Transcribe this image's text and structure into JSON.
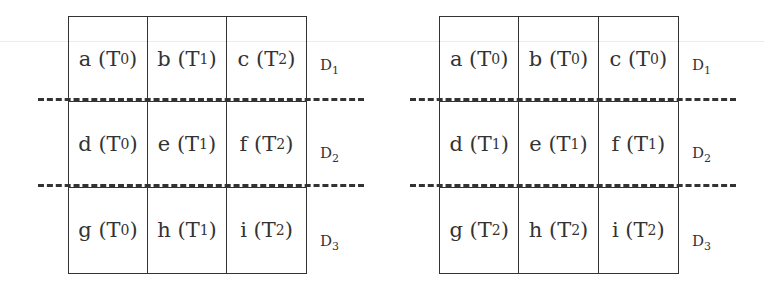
{
  "figure": {
    "left_panel": {
      "cells": [
        {
          "letter": "a",
          "t": "0"
        },
        {
          "letter": "b",
          "t": "1"
        },
        {
          "letter": "c",
          "t": "2"
        },
        {
          "letter": "d",
          "t": "0"
        },
        {
          "letter": "e",
          "t": "1"
        },
        {
          "letter": "f",
          "t": "2"
        },
        {
          "letter": "g",
          "t": "0"
        },
        {
          "letter": "h",
          "t": "1"
        },
        {
          "letter": "i",
          "t": "2"
        }
      ],
      "row_labels": [
        {
          "d": "D",
          "n": "1"
        },
        {
          "d": "D",
          "n": "2"
        },
        {
          "d": "D",
          "n": "3"
        }
      ]
    },
    "right_panel": {
      "cells": [
        {
          "letter": "a",
          "t": "0"
        },
        {
          "letter": "b",
          "t": "0"
        },
        {
          "letter": "c",
          "t": "0"
        },
        {
          "letter": "d",
          "t": "1"
        },
        {
          "letter": "e",
          "t": "1"
        },
        {
          "letter": "f",
          "t": "1"
        },
        {
          "letter": "g",
          "t": "2"
        },
        {
          "letter": "h",
          "t": "2"
        },
        {
          "letter": "i",
          "t": "2"
        }
      ],
      "row_labels": [
        {
          "d": "D",
          "n": "1"
        },
        {
          "d": "D",
          "n": "2"
        },
        {
          "d": "D",
          "n": "3"
        }
      ]
    },
    "cell_text_prefix": "T",
    "line_color": "#333333"
  }
}
